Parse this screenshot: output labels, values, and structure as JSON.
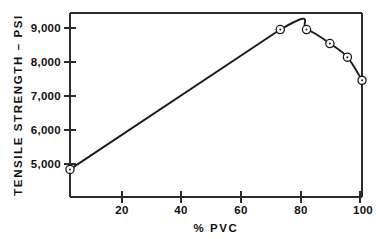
{
  "chart_data": {
    "type": "line",
    "title": "",
    "xlabel": "% PVC",
    "ylabel": "TENSILE STRENGTH – PSI",
    "xlim": [
      0,
      100
    ],
    "ylim": [
      4450,
      9450
    ],
    "grid": false,
    "legend": "none",
    "marker": "circle-dot",
    "line_color": "#1a1a1a",
    "background_color": "#ffffff",
    "x": [
      0,
      72,
      81,
      89,
      95,
      100
    ],
    "values": [
      5200,
      9000,
      9000,
      8620,
      8250,
      7620
    ],
    "points": [
      {
        "x": 0,
        "y": 5200
      },
      {
        "x": 72,
        "y": 9000
      },
      {
        "x": 81,
        "y": 9000
      },
      {
        "x": 89,
        "y": 8620
      },
      {
        "x": 95,
        "y": 8250
      },
      {
        "x": 100,
        "y": 7620
      }
    ],
    "xticks": [
      20,
      40,
      60,
      80,
      100
    ],
    "xtick_labels": [
      "20",
      "40",
      "60",
      "80",
      "100"
    ],
    "yticks": [
      5000,
      6000,
      7000,
      8000,
      9000
    ],
    "ytick_labels": [
      "5,000",
      "6,000",
      "7,000",
      "8,000",
      "9,000"
    ]
  },
  "axes": {
    "x_title": "% PVC",
    "y_title": "TENSILE STRENGTH – PSI"
  },
  "ticks": {
    "y": [
      {
        "label": "9,000",
        "value": 9000
      },
      {
        "label": "8,000",
        "value": 8000
      },
      {
        "label": "7,000",
        "value": 7000
      },
      {
        "label": "6,000",
        "value": 6000
      },
      {
        "label": "5,000",
        "value": 5000
      }
    ],
    "x": [
      {
        "label": "20",
        "value": 20
      },
      {
        "label": "40",
        "value": 40
      },
      {
        "label": "60",
        "value": 60
      },
      {
        "label": "80",
        "value": 80
      },
      {
        "label": "100",
        "value": 100
      }
    ]
  }
}
